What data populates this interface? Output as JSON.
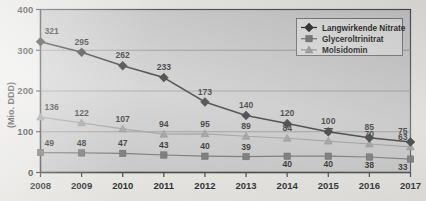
{
  "chart_data": {
    "type": "line",
    "title": "",
    "xlabel": "",
    "ylabel": "(Mio. DDD)",
    "categories": [
      "2008",
      "2009",
      "2010",
      "2011",
      "2012",
      "2013",
      "2014",
      "2015",
      "2016",
      "2017"
    ],
    "ylim": [
      0,
      400
    ],
    "yticks": [
      0,
      100,
      200,
      300,
      400
    ],
    "grid": true,
    "legend_position": "top-right",
    "series": [
      {
        "name": "Langwirkende Nitrate",
        "marker": "diamond",
        "color": "#262626",
        "values": [
          321,
          295,
          262,
          233,
          173,
          140,
          120,
          100,
          85,
          75
        ]
      },
      {
        "name": "Glyceroltrinitrat",
        "marker": "square",
        "color": "#6f6f6f",
        "values": [
          49,
          48,
          47,
          43,
          40,
          39,
          40,
          40,
          38,
          33
        ]
      },
      {
        "name": "Molsidomin",
        "marker": "triangle",
        "color": "#9a9a9a",
        "values": [
          136,
          122,
          107,
          94,
          95,
          89,
          84,
          77,
          70,
          63
        ]
      }
    ]
  },
  "axis": {
    "y_title": "(Mio. DDD)",
    "y_tick_labels": [
      "400",
      "300",
      "200",
      "100",
      "0"
    ],
    "x_tick_labels": [
      "2008",
      "2009",
      "2010",
      "2011",
      "2012",
      "2013",
      "2014",
      "2015",
      "2016",
      "2017"
    ]
  },
  "legend": {
    "items": [
      {
        "label": "Langwirkende Nitrate",
        "marker": "diamond-marker-icon"
      },
      {
        "label": "Glyceroltrinitrat",
        "marker": "square-marker-icon"
      },
      {
        "label": "Molsidomin",
        "marker": "triangle-marker-icon"
      }
    ]
  },
  "labels": {
    "langwirkende_nitrate": [
      "321",
      "295",
      "262",
      "233",
      "173",
      "140",
      "120",
      "100",
      "85",
      "75"
    ],
    "glyceroltrinitrat": [
      "49",
      "48",
      "47",
      "43",
      "40",
      "39",
      "40",
      "40",
      "38",
      "33"
    ],
    "molsidomin": [
      "136",
      "122",
      "107",
      "94",
      "95",
      "89",
      "84",
      "77",
      "70",
      "63"
    ]
  },
  "colors": {
    "plot_background": "#c9c9c9",
    "page_background": "#e9e8e4",
    "plot_border": "#4a4a4a",
    "gridline": "#8e8e8e",
    "series_nitrate": "#262626",
    "series_glycerol": "#6f6f6f",
    "series_molsidomin": "#9a9a9a",
    "legend_background": "#dedede"
  }
}
